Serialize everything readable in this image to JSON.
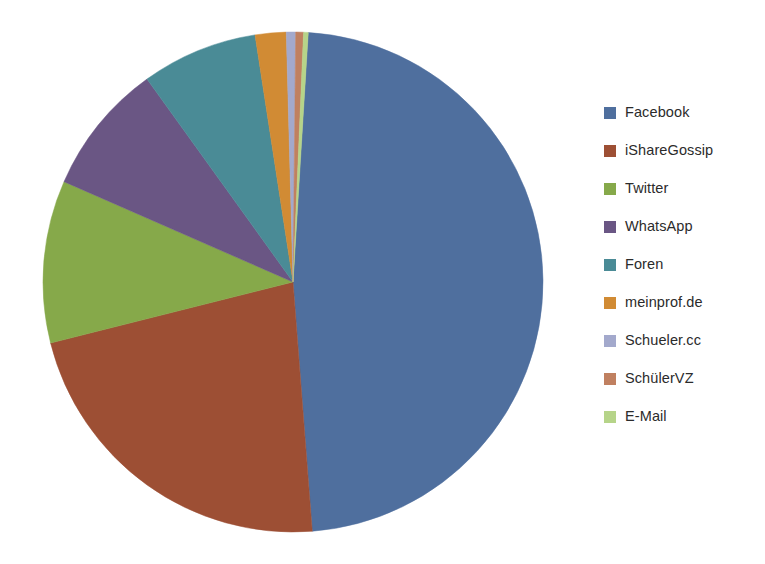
{
  "chart_data": {
    "type": "pie",
    "title": "",
    "subtitle": "",
    "xlabel": "",
    "ylabel": "",
    "legend_position": "right",
    "grid": false,
    "start_angle_deg": 3.5,
    "direction": "clockwise",
    "categories": [
      "Facebook",
      "iShareGossip",
      "Twitter",
      "WhatsApp",
      "Foren",
      "meinprof.de",
      "Schueler.cc",
      "SchülerVZ",
      "E-Mail"
    ],
    "values": [
      47.8,
      22.3,
      10.5,
      8.5,
      7.5,
      2.0,
      0.6,
      0.5,
      0.3
    ],
    "colors": [
      "#4f6f9e",
      "#9d4f34",
      "#86a94a",
      "#6a5684",
      "#4a8b96",
      "#d18b34",
      "#a3a9cc",
      "#c08060",
      "#b6d489"
    ],
    "slices": [
      {
        "label": "Facebook",
        "value": 47.8,
        "color": "#4f6f9e"
      },
      {
        "label": "iShareGossip",
        "value": 22.3,
        "color": "#9d4f34"
      },
      {
        "label": "Twitter",
        "value": 10.5,
        "color": "#86a94a"
      },
      {
        "label": "WhatsApp",
        "value": 8.5,
        "color": "#6a5684"
      },
      {
        "label": "Foren",
        "value": 7.5,
        "color": "#4a8b96"
      },
      {
        "label": "meinprof.de",
        "value": 2.0,
        "color": "#d18b34"
      },
      {
        "label": "Schueler.cc",
        "value": 0.6,
        "color": "#a3a9cc"
      },
      {
        "label": "SchülerVZ",
        "value": 0.5,
        "color": "#c08060"
      },
      {
        "label": "E-Mail",
        "value": 0.3,
        "color": "#b6d489"
      }
    ],
    "geometry": {
      "center_x": 293,
      "center_y": 282,
      "radius": 250
    }
  },
  "legend": {
    "items": [
      {
        "label": "Facebook",
        "color": "#4f6f9e"
      },
      {
        "label": "iShareGossip",
        "color": "#9d4f34"
      },
      {
        "label": "Twitter",
        "color": "#86a94a"
      },
      {
        "label": "WhatsApp",
        "color": "#6a5684"
      },
      {
        "label": "Foren",
        "color": "#4a8b96"
      },
      {
        "label": "meinprof.de",
        "color": "#d18b34"
      },
      {
        "label": "Schueler.cc",
        "color": "#a3a9cc"
      },
      {
        "label": "SchülerVZ",
        "color": "#c08060"
      },
      {
        "label": "E-Mail",
        "color": "#b6d489"
      }
    ]
  }
}
